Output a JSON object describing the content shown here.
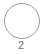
{
  "step": {
    "number": "2",
    "state": "inactive",
    "colors": {
      "border": "#9a9a9a",
      "fill": "#ffffff",
      "label": "#6f6f6f"
    }
  }
}
